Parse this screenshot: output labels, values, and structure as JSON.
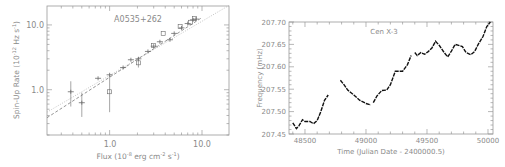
{
  "chart_data": [
    {
      "type": "scatter",
      "title": "A0535+262",
      "xlabel": "Flux (10^-8 erg cm^-2 s^-1)",
      "ylabel": "Spin-Up Rate (10^-12 Hz s^-1)",
      "xscale": "log",
      "yscale": "log",
      "xlim": [
        0.21,
        19.6
      ],
      "ylim": [
        0.2,
        19.6
      ],
      "xticks": [
        "1.0",
        "10.0"
      ],
      "yticks": [
        "1.0",
        "10.0"
      ],
      "grid": false,
      "series": [
        {
          "name": "plus-markers",
          "marker": "+",
          "points": [
            {
              "x": 0.38,
              "y": 0.93,
              "yerr": [
                0.55,
                1.35
              ]
            },
            {
              "x": 0.5,
              "y": 0.63,
              "yerr": [
                0.38,
                0.9
              ]
            },
            {
              "x": 0.75,
              "y": 1.5
            },
            {
              "x": 1.0,
              "y": 1.7
            },
            {
              "x": 1.4,
              "y": 2.2
            },
            {
              "x": 1.7,
              "y": 2.9
            },
            {
              "x": 2.05,
              "y": 3.0
            },
            {
              "x": 2.6,
              "y": 3.9
            },
            {
              "x": 3.0,
              "y": 4.7
            },
            {
              "x": 3.5,
              "y": 5.5
            },
            {
              "x": 4.5,
              "y": 5.9
            },
            {
              "x": 5.0,
              "y": 7.4
            },
            {
              "x": 6.0,
              "y": 9.0
            },
            {
              "x": 7.0,
              "y": 10.5
            },
            {
              "x": 8.0,
              "y": 12.0
            },
            {
              "x": 8.6,
              "y": 12.3
            }
          ]
        },
        {
          "name": "square-markers",
          "marker": "square",
          "points": [
            {
              "x": 1.0,
              "y": 0.93,
              "yerr": [
                0.45,
                1.65
              ]
            },
            {
              "x": 2.05,
              "y": 2.6,
              "yerr": [
                2.2,
                3.2
              ]
            },
            {
              "x": 3.0,
              "y": 4.8
            },
            {
              "x": 3.8,
              "y": 7.4
            },
            {
              "x": 5.8,
              "y": 9.5
            },
            {
              "x": 7.5,
              "y": 11.0
            },
            {
              "x": 8.3,
              "y": 12.5
            }
          ]
        }
      ],
      "fits": [
        {
          "name": "dotted-fit",
          "style": "dotted",
          "points": [
            {
              "x": 0.21,
              "y": 0.45
            },
            {
              "x": 19.6,
              "y": 20.0
            }
          ]
        },
        {
          "name": "dashed-fit",
          "style": "dashed",
          "points": [
            {
              "x": 0.21,
              "y": 0.37
            },
            {
              "x": 10.0,
              "y": 13.0
            }
          ]
        }
      ]
    },
    {
      "type": "line",
      "title": "Cen X-3",
      "xlabel": "Time (Julian Date - 2400000.5)",
      "ylabel": "Frequency (mHz)",
      "xlim": [
        48369,
        50041
      ],
      "ylim": [
        207.45,
        207.7
      ],
      "xticks": [
        "48500",
        "49000",
        "49500",
        "50000"
      ],
      "yticks": [
        "207.45",
        "207.50",
        "207.55",
        "207.60",
        "207.65",
        "207.70"
      ],
      "grid": false,
      "segments": [
        [
          [
            48400,
            207.475
          ],
          [
            48430,
            207.462
          ],
          [
            48450,
            207.468
          ],
          [
            48480,
            207.482
          ],
          [
            48500,
            207.478
          ],
          [
            48540,
            207.478
          ],
          [
            48570,
            207.473
          ],
          [
            48600,
            207.48
          ],
          [
            48630,
            207.5
          ],
          [
            48660,
            207.525
          ],
          [
            48690,
            207.537
          ]
        ],
        [
          [
            48790,
            207.57
          ],
          [
            48820,
            207.56
          ],
          [
            48850,
            207.548
          ],
          [
            48900,
            207.537
          ],
          [
            48950,
            207.525
          ],
          [
            49000,
            207.518
          ],
          [
            49040,
            207.515
          ]
        ],
        [
          [
            49060,
            207.52
          ],
          [
            49090,
            207.535
          ],
          [
            49130,
            207.547
          ],
          [
            49170,
            207.548
          ],
          [
            49200,
            207.56
          ],
          [
            49240,
            207.59
          ],
          [
            49270,
            207.59
          ],
          [
            49300,
            207.59
          ],
          [
            49340,
            207.605
          ],
          [
            49370,
            207.625
          ]
        ],
        [
          [
            49400,
            207.632
          ],
          [
            49420,
            207.625
          ],
          [
            49450,
            207.632
          ],
          [
            49480,
            207.628
          ],
          [
            49510,
            207.634
          ],
          [
            49540,
            207.642
          ],
          [
            49570,
            207.657
          ],
          [
            49600,
            207.648
          ],
          [
            49640,
            207.632
          ],
          [
            49670,
            207.622
          ],
          [
            49700,
            207.635
          ],
          [
            49730,
            207.65
          ],
          [
            49760,
            207.648
          ],
          [
            49790,
            207.645
          ],
          [
            49820,
            207.632
          ],
          [
            49860,
            207.627
          ],
          [
            49890,
            207.634
          ],
          [
            49920,
            207.65
          ],
          [
            49960,
            207.668
          ],
          [
            49990,
            207.69
          ],
          [
            50020,
            207.7
          ]
        ]
      ]
    }
  ],
  "left_chart": {
    "title": "A0535+262",
    "xtick_1": "1.0",
    "xtick_10": "10.0",
    "ytick_1": "1.0",
    "ytick_10": "10.0",
    "xlabel_main": "Flux (10",
    "xlabel_exp1": "-8",
    "xlabel_mid": " erg cm",
    "xlabel_exp2": "-2",
    "xlabel_mid2": " s",
    "xlabel_exp3": "-1",
    "xlabel_end": ")",
    "ylabel_main": "Spin-Up Rate (10",
    "ylabel_exp1": "-12",
    "ylabel_mid": " Hz s",
    "ylabel_exp2": "-1",
    "ylabel_end": ")"
  },
  "right_chart": {
    "title": "Cen X-3",
    "xlabel": "Time (Julian Date - 2400000.5)",
    "ylabel": "Frequency (mHz)",
    "xticks": [
      "48500",
      "49000",
      "49500",
      "50000"
    ],
    "yticks": [
      "207.45",
      "207.50",
      "207.55",
      "207.60",
      "207.65",
      "207.70"
    ]
  },
  "colors": {
    "axis": "#9a9a9a",
    "text": "#8a8a8a",
    "marker": "#6a6a6a",
    "curve": "#111111"
  }
}
